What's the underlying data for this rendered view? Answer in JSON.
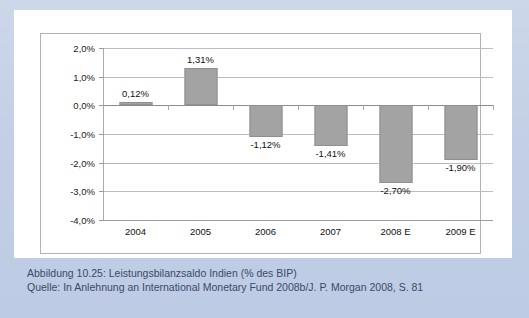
{
  "figure": {
    "caption_line_1": "Abbildung 10.25:  Leistungsbilanzsaldo Indien (% des BIP)",
    "caption_line_2": "Quelle: In Anlehnung an International Monetary Fund 2008b/J. P. Morgan 2008, S. 81"
  },
  "colors": {
    "page_background": "#c3d0e6",
    "card_background": "#ffffff",
    "bar_fill": "#a3a3a3",
    "bar_stroke": "#8f8f8f",
    "gridline": "#bcbcbc",
    "zero_line": "#8c8c8c",
    "caption_text": "#3c4a66",
    "axis_text": "#111111"
  },
  "chart_data": {
    "type": "bar",
    "title": "Leistungsbilanzsaldo Indien (% des BIP)",
    "xlabel": "",
    "ylabel": "",
    "categories": [
      "2004",
      "2005",
      "2006",
      "2007",
      "2008 E",
      "2009 E"
    ],
    "values": [
      0.12,
      1.31,
      -1.12,
      -1.41,
      -2.7,
      -1.9
    ],
    "value_labels": [
      "0,12%",
      "1,31%",
      "-1,12%",
      "-1,41%",
      "-2,70%",
      "-1,90%"
    ],
    "ylim": [
      -4.0,
      2.0
    ],
    "ytick_values": [
      2.0,
      1.0,
      0.0,
      -1.0,
      -2.0,
      -3.0,
      -4.0
    ],
    "ytick_labels": [
      "2,0%",
      "1,0%",
      "0,0%",
      "-1,0%",
      "-2,0%",
      "-3,0%",
      "-4,0%"
    ],
    "grid": true,
    "legend": "none",
    "orientation": "vertical"
  }
}
